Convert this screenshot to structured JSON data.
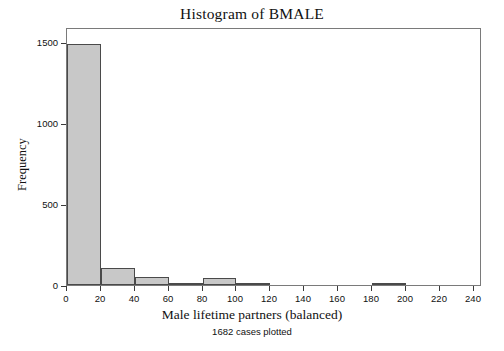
{
  "chart_data": {
    "type": "bar",
    "title": "Histogram of BMALE",
    "subtitle": "1682 cases plotted",
    "xlabel": "Male lifetime partners (balanced)",
    "ylabel": "Frequency",
    "bin_width": 20,
    "bin_starts": [
      0,
      20,
      40,
      60,
      80,
      100,
      120,
      140,
      160,
      180,
      200,
      220
    ],
    "categories": [
      "0-20",
      "20-40",
      "40-60",
      "60-80",
      "80-100",
      "100-120",
      "120-140",
      "140-160",
      "160-180",
      "180-200",
      "200-220",
      "220-240"
    ],
    "values": [
      1485,
      105,
      50,
      5,
      45,
      5,
      0,
      0,
      0,
      15,
      0,
      0
    ],
    "xlim": [
      0,
      245
    ],
    "ylim": [
      0,
      1590
    ],
    "xticks": [
      0,
      20,
      40,
      60,
      80,
      100,
      120,
      140,
      160,
      180,
      200,
      220,
      240
    ],
    "xtick_labels": [
      "0",
      "20",
      "40",
      "60",
      "80",
      "100",
      "120",
      "140",
      "160",
      "180",
      "200",
      "220",
      "240"
    ],
    "yticks": [
      0,
      500,
      1000,
      1500
    ],
    "ytick_labels": [
      "0",
      "500",
      "1000",
      "1500"
    ],
    "grid": false,
    "legend": "none",
    "bar_fill_color": "#c8c8c8",
    "bar_edge_color": "#4a4a4a",
    "frame_color": "#7a7a7a",
    "background_color": "#ffffff"
  }
}
